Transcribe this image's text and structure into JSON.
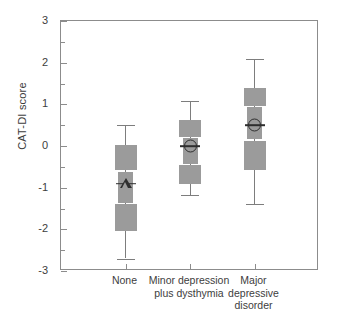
{
  "chart_data": {
    "type": "box",
    "title": "",
    "xlabel": "",
    "ylabel": "CAT-DI score",
    "ylim": [
      -3,
      3
    ],
    "ytick_values": [
      -3,
      -2,
      -1,
      0,
      1,
      2,
      3
    ],
    "ytick_labels": [
      "-3",
      "-2",
      "-1",
      "0",
      "1",
      "2",
      "3"
    ],
    "yminor_values": [
      -2.5,
      -1.5,
      -0.5,
      0.5,
      1.5,
      2.5
    ],
    "grid": false,
    "legend": "none",
    "categories": [
      "None",
      "Minor depression\nplus dysthymia",
      "Major\ndepressive\ndisorder"
    ],
    "boxes": [
      {
        "category": "None",
        "whisker_low": -2.7,
        "box_low": -2.05,
        "notch_low": -1.4,
        "median": -0.9,
        "notch_high": -0.62,
        "box_high": 0.02,
        "whisker_high": 0.5,
        "marker": "triangle"
      },
      {
        "category": "Minor depression plus dysthymia",
        "whisker_low": -1.18,
        "box_low": -0.91,
        "notch_low": -0.46,
        "median": 0.0,
        "notch_high": 0.19,
        "box_high": 0.62,
        "whisker_high": 1.08,
        "marker": "circle"
      },
      {
        "category": "Major depressive disorder",
        "whisker_low": -1.39,
        "box_low": -0.57,
        "notch_low": 0.13,
        "median": 0.5,
        "notch_high": 0.93,
        "box_high": 1.39,
        "whisker_high": 2.09,
        "marker": "circle"
      }
    ],
    "colors": {
      "box_fill": "#9b9b9b",
      "whisker": "#7d7d7d",
      "marker": "#2e2e2e",
      "axis": "#8c8c8c",
      "text": "#3d3d3d",
      "background": "#ffffff"
    }
  }
}
